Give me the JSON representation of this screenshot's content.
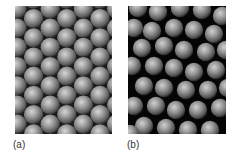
{
  "figure": {
    "panels": [
      {
        "id": "a",
        "label": "(a)",
        "description": "close-packed ordered sphere array"
      },
      {
        "id": "b",
        "label": "(b)",
        "description": "loosely packed disordered sphere array"
      }
    ],
    "colors": {
      "sphere_highlight": "#d8d8d8",
      "sphere_mid": "#8a8a8a",
      "sphere_edge": "#3a3a3a",
      "background_a": "#1a1a1a",
      "background_b": "#050505"
    }
  }
}
